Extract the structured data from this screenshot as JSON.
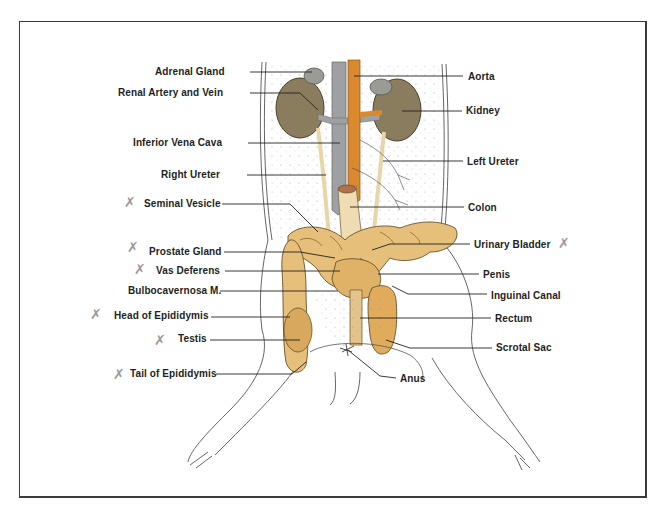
{
  "figure": {
    "labels_left": [
      {
        "id": "adrenal-gland",
        "text": "Adrenal Gland",
        "x": 246,
        "y": 72,
        "marked": false
      },
      {
        "id": "renal-artery-vein",
        "text": "Renal Artery and Vein",
        "x": 246,
        "y": 93,
        "marked": false
      },
      {
        "id": "inferior-vena-cava",
        "text": "Inferior Vena Cava",
        "x": 244,
        "y": 143,
        "marked": false
      },
      {
        "id": "right-ureter",
        "text": "Right Ureter",
        "x": 243,
        "y": 174,
        "marked": false
      },
      {
        "id": "seminal-vesicle",
        "text": "Seminal Vesicle",
        "x": 218,
        "y": 203,
        "marked": true
      },
      {
        "id": "prostate-gland",
        "text": "Prostate Gland",
        "x": 220,
        "y": 251,
        "marked": true
      },
      {
        "id": "vas-deferens",
        "text": "Vas Deferens",
        "x": 221,
        "y": 270,
        "marked": true
      },
      {
        "id": "bulbocavernosa",
        "text": "Bulbocavernosa M.",
        "x": 216,
        "y": 290,
        "marked": false
      },
      {
        "id": "head-of-epididymis",
        "text": "Head of Epididymis",
        "x": 207,
        "y": 316,
        "marked": true
      },
      {
        "id": "testis",
        "text": "Testis",
        "x": 207,
        "y": 339,
        "marked": true
      },
      {
        "id": "tail-of-epididymis",
        "text": "Tail of Epididymis",
        "x": 212,
        "y": 374,
        "marked": true
      }
    ],
    "labels_right": [
      {
        "id": "aorta",
        "text": "Aorta",
        "x": 468,
        "y": 76,
        "marked": false
      },
      {
        "id": "kidney",
        "text": "Kidney",
        "x": 466,
        "y": 110,
        "marked": false
      },
      {
        "id": "left-ureter",
        "text": "Left Ureter",
        "x": 467,
        "y": 161,
        "marked": false
      },
      {
        "id": "colon",
        "text": "Colon",
        "x": 468,
        "y": 207,
        "marked": false
      },
      {
        "id": "urinary-bladder",
        "text": "Urinary Bladder",
        "x": 474,
        "y": 244,
        "marked": true
      },
      {
        "id": "penis",
        "text": "Penis",
        "x": 483,
        "y": 274,
        "marked": false
      },
      {
        "id": "inguinal-canal",
        "text": "Inguinal Canal",
        "x": 491,
        "y": 295,
        "marked": false
      },
      {
        "id": "rectum",
        "text": "Rectum",
        "x": 495,
        "y": 318,
        "marked": false
      },
      {
        "id": "scrotal-sac",
        "text": "Scrotal Sac",
        "x": 496,
        "y": 347,
        "marked": false
      },
      {
        "id": "anus",
        "text": "Anus",
        "x": 400,
        "y": 378,
        "marked": false
      }
    ],
    "check_mark_glyph": "✗",
    "colors": {
      "kidney": "#8a7d5e",
      "adrenal": "#9b9b96",
      "vena_cava": "#9fa0a3",
      "aorta": "#d98a2e",
      "tissue": "#e6bf7a",
      "tissue_dark": "#c99a4e",
      "ureter": "#f0e2c0",
      "colon": "#efdcb3",
      "border": "#3a3a3a",
      "text": "#1e1e1e",
      "pencil": "#9a9a9a"
    }
  }
}
